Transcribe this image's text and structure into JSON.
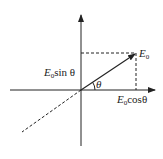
{
  "diagram": {
    "type": "vector-decomposition",
    "colors": {
      "line": "#222222",
      "background": "#ffffff"
    },
    "origin": {
      "x": 81,
      "y": 90
    },
    "axes": {
      "vertical": {
        "x": 81,
        "y_top": 15,
        "y_bottom": 146,
        "arrow": "top"
      },
      "horizontal": {
        "y": 90,
        "x_left": 10,
        "x_right": 155,
        "arrow": "right"
      }
    },
    "vector": {
      "name": "E0",
      "tip": {
        "x": 136,
        "y": 53
      }
    },
    "extension": {
      "style": "dashed",
      "end": {
        "x": 22,
        "y": 132
      }
    },
    "projections": {
      "horizontal_dashed": {
        "y": 53,
        "x_from": 81,
        "x_to": 136
      },
      "vertical_dashed": {
        "x": 136,
        "y_from": 53,
        "y_to": 90
      }
    },
    "labels": {
      "vector_main": "E",
      "vector_sub": "0",
      "sin_main": "E",
      "sin_sub": "0",
      "sin_text": "sin θ",
      "cos_main": "E",
      "cos_sub": "0",
      "cos_text": "cosθ",
      "angle": "θ"
    }
  }
}
